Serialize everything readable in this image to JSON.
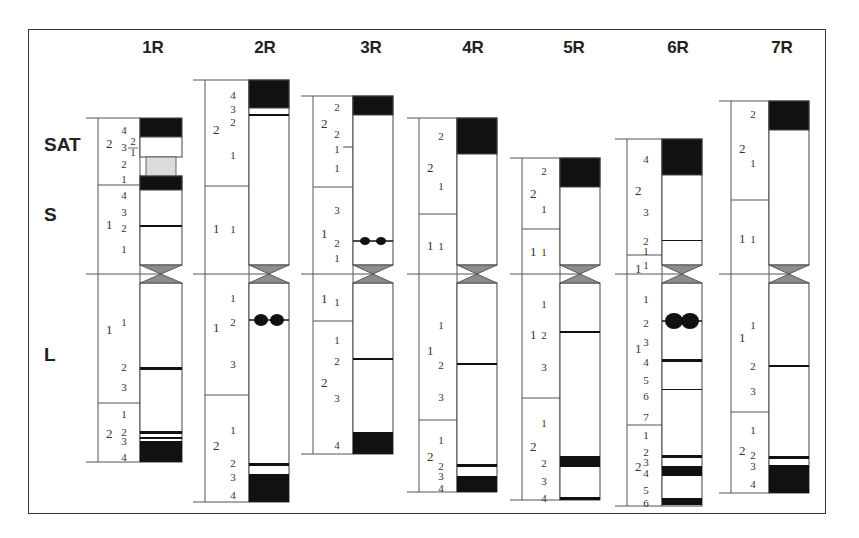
{
  "figure": {
    "type": "idiogram",
    "row_labels": [
      {
        "label": "SAT",
        "y": 145
      },
      {
        "label": "S",
        "y": 215
      },
      {
        "label": "L",
        "y": 355
      }
    ],
    "centromere_y": 274,
    "colors": {
      "dark_band": "#111111",
      "light_band": "#ffffff",
      "satellite_stalk": "#dcdcdc",
      "centromere": "#8c8c8c",
      "outline": "#444444"
    }
  },
  "chromosomes": [
    {
      "name": "1R",
      "header_x": 153,
      "x": 140,
      "w": 42,
      "bx": 98,
      "top": 118,
      "bottom": 462,
      "short_arm_regions": [
        {
          "label": "2",
          "y_top": 118,
          "y_bot": 185,
          "lbl_y": 144
        },
        {
          "label": "1",
          "y_top": 185,
          "y_bot": 274,
          "lbl_y": 225
        }
      ],
      "long_arm_regions": [
        {
          "label": "1",
          "y_top": 274,
          "y_bot": 403,
          "lbl_y": 330
        },
        {
          "label": "2",
          "y_top": 403,
          "y_bot": 462,
          "lbl_y": 434
        }
      ],
      "band_labels": [
        {
          "t": "4",
          "y": 130
        },
        {
          "t": "3",
          "y": 147
        },
        {
          "t": "2",
          "y": 164
        },
        {
          "t": "1",
          "y": 179
        },
        {
          "t": "4",
          "y": 195
        },
        {
          "t": "3",
          "y": 212
        },
        {
          "t": "2",
          "y": 228
        },
        {
          "t": "1",
          "y": 249
        },
        {
          "t": "1",
          "y": 322
        },
        {
          "t": "2",
          "y": 367
        },
        {
          "t": "3",
          "y": 387
        },
        {
          "t": "1",
          "y": 414
        },
        {
          "t": "2",
          "y": 432
        },
        {
          "t": "3",
          "y": 441
        },
        {
          "t": "4",
          "y": 457
        }
      ],
      "sub_labels": [
        {
          "t": "2",
          "x": 133,
          "y": 145
        },
        {
          "t": "1",
          "x": 133,
          "y": 156
        }
      ],
      "blocks": [
        {
          "y": 118,
          "h": 19,
          "fill": "dark"
        },
        {
          "y": 137,
          "h": 20,
          "fill": "light"
        },
        {
          "y": 157,
          "h": 19,
          "fill": "stalk",
          "narrow": true
        },
        {
          "y": 176,
          "h": 14,
          "fill": "dark"
        }
      ],
      "lines": [
        {
          "y": 225,
          "h": 2
        },
        {
          "y": 367,
          "h": 3
        },
        {
          "y": 431,
          "h": 3
        },
        {
          "y": 437,
          "h": 2
        }
      ],
      "bottom_dark": {
        "y": 441,
        "h": 21
      },
      "satellite": true
    },
    {
      "name": "2R",
      "header_x": 265,
      "x": 249,
      "w": 40,
      "bx": 205,
      "top": 80,
      "bottom": 502,
      "short_arm_regions": [
        {
          "label": "2",
          "y_top": 80,
          "y_bot": 186,
          "lbl_y": 130
        },
        {
          "label": "1",
          "y_top": 186,
          "y_bot": 274,
          "lbl_y": 229
        }
      ],
      "long_arm_regions": [
        {
          "label": "1",
          "y_top": 274,
          "y_bot": 395,
          "lbl_y": 328
        },
        {
          "label": "2",
          "y_top": 395,
          "y_bot": 502,
          "lbl_y": 446
        }
      ],
      "band_labels": [
        {
          "t": "4",
          "y": 95
        },
        {
          "t": "3",
          "y": 109
        },
        {
          "t": "2",
          "y": 122
        },
        {
          "t": "1",
          "y": 155
        },
        {
          "t": "1",
          "y": 229
        },
        {
          "t": "1",
          "y": 298
        },
        {
          "t": "2",
          "y": 322
        },
        {
          "t": "3",
          "y": 364
        },
        {
          "t": "1",
          "y": 430
        },
        {
          "t": "2",
          "y": 463
        },
        {
          "t": "3",
          "y": 477
        },
        {
          "t": "4",
          "y": 495
        }
      ],
      "blocks": [
        {
          "y": 80,
          "h": 28,
          "fill": "dark"
        }
      ],
      "lines": [
        {
          "y": 114,
          "h": 2
        },
        {
          "y": 463,
          "h": 3
        }
      ],
      "bottom_dark": {
        "y": 474,
        "h": 28
      },
      "satellite_dots": {
        "y": 320,
        "r": 6
      }
    },
    {
      "name": "3R",
      "header_x": 371,
      "x": 353,
      "w": 40,
      "bx": 313,
      "top": 96,
      "bottom": 454,
      "short_arm_regions": [
        {
          "label": "2",
          "y_top": 96,
          "y_bot": 187,
          "lbl_y": 124
        },
        {
          "label": "1",
          "y_top": 187,
          "y_bot": 274,
          "lbl_y": 234
        }
      ],
      "long_arm_regions": [
        {
          "label": "1",
          "y_top": 274,
          "y_bot": 321,
          "lbl_y": 299
        },
        {
          "label": "2",
          "y_top": 321,
          "y_bot": 454,
          "lbl_y": 383
        }
      ],
      "band_labels": [
        {
          "t": "2",
          "y": 107
        },
        {
          "t": "2",
          "y": 134
        },
        {
          "t": "1",
          "y": 149
        },
        {
          "t": "1",
          "y": 168
        },
        {
          "t": "3",
          "y": 210
        },
        {
          "t": "2",
          "y": 243
        },
        {
          "t": "1",
          "y": 258
        },
        {
          "t": "1",
          "y": 302
        },
        {
          "t": "1",
          "y": 340
        },
        {
          "t": "2",
          "y": 361
        },
        {
          "t": "3",
          "y": 398
        },
        {
          "t": "4",
          "y": 445
        }
      ],
      "tick": {
        "y": 147
      },
      "blocks": [
        {
          "y": 96,
          "h": 19,
          "fill": "dark"
        }
      ],
      "lines": [
        {
          "y": 358,
          "h": 2
        }
      ],
      "bottom_dark": {
        "y": 432,
        "h": 22
      },
      "satellite_dots": {
        "y": 241,
        "r": 4
      }
    },
    {
      "name": "4R",
      "header_x": 473,
      "x": 457,
      "w": 40,
      "bx": 419,
      "top": 118,
      "bottom": 492,
      "short_arm_regions": [
        {
          "label": "2",
          "y_top": 118,
          "y_bot": 214,
          "lbl_y": 168
        },
        {
          "label": "1",
          "y_top": 214,
          "y_bot": 274,
          "lbl_y": 246
        }
      ],
      "long_arm_regions": [
        {
          "label": "1",
          "y_top": 274,
          "y_bot": 420,
          "lbl_y": 351
        },
        {
          "label": "2",
          "y_top": 420,
          "y_bot": 492,
          "lbl_y": 457
        }
      ],
      "band_labels": [
        {
          "t": "2",
          "y": 136
        },
        {
          "t": "1",
          "y": 186
        },
        {
          "t": "1",
          "y": 246
        },
        {
          "t": "1",
          "y": 325
        },
        {
          "t": "2",
          "y": 365
        },
        {
          "t": "3",
          "y": 397
        },
        {
          "t": "1",
          "y": 440
        },
        {
          "t": "2",
          "y": 466
        },
        {
          "t": "3",
          "y": 476
        },
        {
          "t": "4",
          "y": 488
        }
      ],
      "blocks": [
        {
          "y": 118,
          "h": 36,
          "fill": "dark"
        }
      ],
      "lines": [
        {
          "y": 363,
          "h": 2
        },
        {
          "y": 464,
          "h": 3
        }
      ],
      "bottom_dark": {
        "y": 476,
        "h": 16
      }
    },
    {
      "name": "5R",
      "header_x": 574,
      "x": 560,
      "w": 40,
      "bx": 522,
      "top": 158,
      "bottom": 500,
      "short_arm_regions": [
        {
          "label": "2",
          "y_top": 158,
          "y_bot": 229,
          "lbl_y": 194
        },
        {
          "label": "1",
          "y_top": 229,
          "y_bot": 274,
          "lbl_y": 252
        }
      ],
      "long_arm_regions": [
        {
          "label": "1",
          "y_top": 274,
          "y_bot": 398,
          "lbl_y": 335
        },
        {
          "label": "2",
          "y_top": 398,
          "y_bot": 500,
          "lbl_y": 447
        }
      ],
      "band_labels": [
        {
          "t": "2",
          "y": 171
        },
        {
          "t": "1",
          "y": 209
        },
        {
          "t": "1",
          "y": 252
        },
        {
          "t": "1",
          "y": 304
        },
        {
          "t": "2",
          "y": 335
        },
        {
          "t": "3",
          "y": 367
        },
        {
          "t": "1",
          "y": 423
        },
        {
          "t": "2",
          "y": 463
        },
        {
          "t": "3",
          "y": 481
        },
        {
          "t": "4",
          "y": 498
        }
      ],
      "blocks": [
        {
          "y": 158,
          "h": 29,
          "fill": "dark"
        }
      ],
      "lines": [
        {
          "y": 331,
          "h": 2
        },
        {
          "y": 497,
          "h": 3
        }
      ],
      "dark_bands": [
        {
          "y": 456,
          "h": 11
        }
      ]
    },
    {
      "name": "6R",
      "header_x": 678,
      "x": 662,
      "w": 40,
      "bx": 627,
      "top": 139,
      "bottom": 506,
      "short_arm_regions": [
        {
          "label": "2",
          "y_top": 139,
          "y_bot": 255,
          "lbl_y": 191
        },
        {
          "label": "1",
          "y_top": 255,
          "y_bot": 274,
          "lbl_y": 269
        }
      ],
      "long_arm_regions": [
        {
          "label": "1",
          "y_top": 274,
          "y_bot": 425,
          "lbl_y": 349
        },
        {
          "label": "2",
          "y_top": 425,
          "y_bot": 506,
          "lbl_y": 467
        }
      ],
      "band_labels": [
        {
          "t": "4",
          "y": 159
        },
        {
          "t": "3",
          "y": 212
        },
        {
          "t": "2",
          "y": 241
        },
        {
          "t": "1",
          "y": 251
        },
        {
          "t": "1",
          "y": 265
        },
        {
          "t": "1",
          "y": 299
        },
        {
          "t": "2",
          "y": 323
        },
        {
          "t": "3",
          "y": 342
        },
        {
          "t": "4",
          "y": 362
        },
        {
          "t": "5",
          "y": 380
        },
        {
          "t": "6",
          "y": 396
        },
        {
          "t": "7",
          "y": 417
        },
        {
          "t": "1",
          "y": 435
        },
        {
          "t": "2",
          "y": 452
        },
        {
          "t": "3",
          "y": 462
        },
        {
          "t": "4",
          "y": 473
        },
        {
          "t": "5",
          "y": 490
        },
        {
          "t": "6",
          "y": 503
        }
      ],
      "blocks": [
        {
          "y": 139,
          "h": 36,
          "fill": "dark"
        }
      ],
      "lines": [
        {
          "y": 240,
          "h": 1
        },
        {
          "y": 359,
          "h": 3
        },
        {
          "y": 389,
          "h": 1
        },
        {
          "y": 455,
          "h": 3
        }
      ],
      "dark_bands": [
        {
          "y": 466,
          "h": 10
        },
        {
          "y": 498,
          "h": 7
        }
      ],
      "satellite_dots": {
        "y": 321,
        "r": 8
      }
    },
    {
      "name": "7R",
      "header_x": 782,
      "x": 769,
      "w": 40,
      "bx": 731,
      "top": 101,
      "bottom": 493,
      "short_arm_regions": [
        {
          "label": "2",
          "y_top": 101,
          "y_bot": 200,
          "lbl_y": 149
        },
        {
          "label": "1",
          "y_top": 200,
          "y_bot": 274,
          "lbl_y": 239
        }
      ],
      "long_arm_regions": [
        {
          "label": "1",
          "y_top": 274,
          "y_bot": 412,
          "lbl_y": 338
        },
        {
          "label": "2",
          "y_top": 412,
          "y_bot": 493,
          "lbl_y": 451
        }
      ],
      "band_labels": [
        {
          "t": "2",
          "y": 114
        },
        {
          "t": "1",
          "y": 163
        },
        {
          "t": "1",
          "y": 239
        },
        {
          "t": "1",
          "y": 325
        },
        {
          "t": "2",
          "y": 366
        },
        {
          "t": "3",
          "y": 391
        },
        {
          "t": "1",
          "y": 430
        },
        {
          "t": "2",
          "y": 455
        },
        {
          "t": "3",
          "y": 466
        },
        {
          "t": "4",
          "y": 484
        }
      ],
      "blocks": [
        {
          "y": 101,
          "h": 29,
          "fill": "dark"
        }
      ],
      "lines": [
        {
          "y": 365,
          "h": 2
        },
        {
          "y": 456,
          "h": 3
        }
      ],
      "bottom_dark": {
        "y": 465,
        "h": 28
      }
    }
  ]
}
